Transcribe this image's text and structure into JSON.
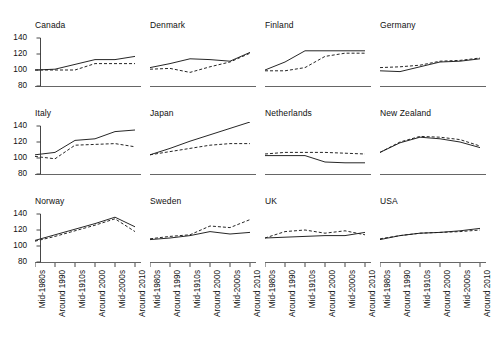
{
  "chart_data": {
    "type": "line",
    "title": "",
    "xlabel": "",
    "ylabel": "",
    "ylim": [
      80,
      145
    ],
    "yticks": [
      80,
      100,
      120,
      140
    ],
    "grid": false,
    "legend_position": "none",
    "categories": [
      "Mid-1980s",
      "Around 1990",
      "Mid-1910s",
      "Around 2000",
      "Mid-2000s",
      "Around 2010"
    ],
    "series_styles": [
      {
        "name": "solid",
        "dash": "none"
      },
      {
        "name": "dashed",
        "dash": "dashed"
      }
    ],
    "panels": [
      {
        "title": "Canada",
        "series": [
          {
            "name": "solid",
            "values": [
              100,
              101,
              107,
              113,
              113,
              117
            ]
          },
          {
            "name": "dashed",
            "values": [
              100,
              100,
              100,
              108,
              108,
              108
            ]
          }
        ]
      },
      {
        "title": "Denmark",
        "series": [
          {
            "name": "solid",
            "values": [
              103,
              108,
              114,
              113,
              111,
              122
            ]
          },
          {
            "name": "dashed",
            "values": [
              101,
              102,
              97,
              104,
              110,
              121
            ]
          }
        ]
      },
      {
        "title": "Finland",
        "series": [
          {
            "name": "solid",
            "values": [
              100,
              110,
              124,
              124,
              124,
              124
            ]
          },
          {
            "name": "dashed",
            "values": [
              99,
              99,
              103,
              117,
              121,
              121
            ]
          }
        ]
      },
      {
        "title": "Germany",
        "series": [
          {
            "name": "solid",
            "values": [
              99,
              98,
              104,
              110,
              111,
              114
            ]
          },
          {
            "name": "dashed",
            "values": [
              103,
              104,
              106,
              111,
              112,
              115
            ]
          }
        ]
      },
      {
        "title": "Italy",
        "series": [
          {
            "name": "solid",
            "values": [
              104,
              107,
              122,
              124,
              133,
              135
            ]
          },
          {
            "name": "dashed",
            "values": [
              102,
              99,
              116,
              117,
              118,
              114
            ]
          }
        ]
      },
      {
        "title": "Japan",
        "series": [
          {
            "name": "solid",
            "values": [
              104,
              112,
              121,
              129,
              137,
              145
            ]
          },
          {
            "name": "dashed",
            "values": [
              104,
              108,
              112,
              116,
              118,
              118
            ]
          }
        ]
      },
      {
        "title": "Netherlands",
        "series": [
          {
            "name": "solid",
            "values": [
              103,
              103,
              103,
              95,
              94,
              94
            ]
          },
          {
            "name": "dashed",
            "values": [
              105,
              107,
              107,
              107,
              106,
              105
            ]
          }
        ]
      },
      {
        "title": "New Zealand",
        "series": [
          {
            "name": "solid",
            "values": [
              107,
              119,
              126,
              124,
              120,
              113
            ]
          },
          {
            "name": "dashed",
            "values": [
              107,
              120,
              127,
              126,
              123,
              115
            ]
          }
        ]
      },
      {
        "title": "Norway",
        "series": [
          {
            "name": "solid",
            "values": [
              107,
              114,
              121,
              128,
              136,
              124
            ]
          },
          {
            "name": "dashed",
            "values": [
              106,
              112,
              119,
              126,
              134,
              118
            ]
          }
        ]
      },
      {
        "title": "Sweden",
        "series": [
          {
            "name": "solid",
            "values": [
              108,
              110,
              113,
              118,
              115,
              117
            ]
          },
          {
            "name": "dashed",
            "values": [
              109,
              112,
              114,
              125,
              123,
              133
            ]
          }
        ]
      },
      {
        "title": "UK",
        "series": [
          {
            "name": "solid",
            "values": [
              110,
              111,
              112,
              113,
              113,
              117
            ]
          },
          {
            "name": "dashed",
            "values": [
              110,
              118,
              120,
              116,
              119,
              114
            ]
          }
        ]
      },
      {
        "title": "USA",
        "series": [
          {
            "name": "solid",
            "values": [
              108,
              113,
              116,
              117,
              119,
              122
            ]
          },
          {
            "name": "dashed",
            "values": [
              109,
              113,
              116,
              117,
              118,
              120
            ]
          }
        ]
      }
    ]
  }
}
